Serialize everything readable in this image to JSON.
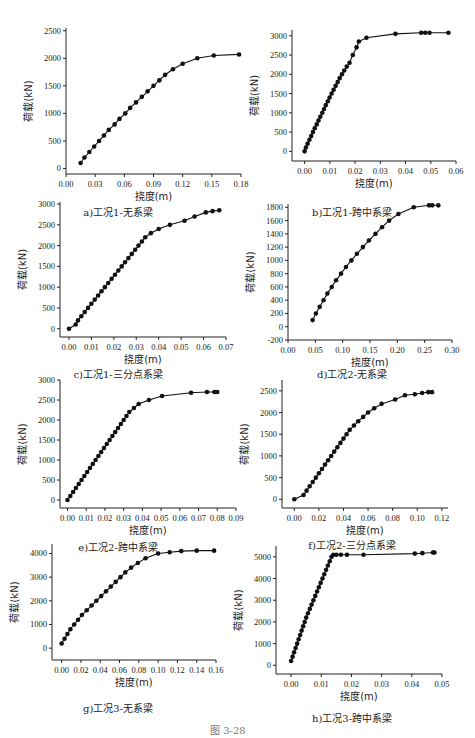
{
  "figure": {
    "caption": "图  3-28"
  },
  "chart_data": [
    {
      "id": "a",
      "type": "line",
      "title": "a)工况1-无系梁",
      "xlabel": "挠度(m)",
      "ylabel": "荷载(kN)",
      "xlim": [
        0.0,
        0.18
      ],
      "ylim": [
        -100,
        2550
      ],
      "xticks": [
        0.0,
        0.03,
        0.06,
        0.09,
        0.12,
        0.15,
        0.18
      ],
      "xtick_labels": [
        "0.00",
        "0.03",
        "0.06",
        "0.09",
        "0.12",
        "0.15",
        "0.18"
      ],
      "yticks": [
        0,
        500,
        1000,
        1500,
        2000,
        2500
      ],
      "ytick_labels": [
        "0",
        "500",
        "1000",
        "1500",
        "2000",
        "2500"
      ],
      "grid": false,
      "markers": true,
      "x": [
        0.015,
        0.019,
        0.024,
        0.029,
        0.034,
        0.039,
        0.044,
        0.05,
        0.055,
        0.061,
        0.066,
        0.072,
        0.078,
        0.084,
        0.09,
        0.096,
        0.102,
        0.11,
        0.12,
        0.135,
        0.152,
        0.178
      ],
      "y": [
        100,
        200,
        300,
        400,
        500,
        600,
        700,
        800,
        900,
        1000,
        1100,
        1200,
        1300,
        1400,
        1500,
        1600,
        1700,
        1800,
        1900,
        2000,
        2050,
        2070
      ]
    },
    {
      "id": "b",
      "type": "line",
      "title": "b)工况1-跨中系梁",
      "xlabel": "挠度(m)",
      "ylabel": "荷载(kN)",
      "xlim": [
        -0.005,
        0.06
      ],
      "ylim": [
        -250,
        3150
      ],
      "xticks": [
        0.0,
        0.01,
        0.02,
        0.03,
        0.04,
        0.05,
        0.06
      ],
      "xtick_labels": [
        "0.00",
        "0.01",
        "0.02",
        "0.03",
        "0.04",
        "0.05",
        "0.06"
      ],
      "yticks": [
        0,
        500,
        1000,
        1500,
        2000,
        2500,
        3000
      ],
      "ytick_labels": [
        "0",
        "500",
        "1000",
        "1500",
        "2000",
        "2500",
        "3000"
      ],
      "grid": false,
      "markers": true,
      "x": [
        0.0,
        0.0005,
        0.0012,
        0.0019,
        0.0026,
        0.0033,
        0.004,
        0.0048,
        0.0055,
        0.0062,
        0.007,
        0.0077,
        0.0084,
        0.0092,
        0.0099,
        0.0107,
        0.0115,
        0.0123,
        0.0131,
        0.0139,
        0.0148,
        0.0157,
        0.0167,
        0.0178,
        0.0191,
        0.0206,
        0.0215,
        0.0245,
        0.036,
        0.0462,
        0.0478,
        0.0495,
        0.057
      ],
      "y": [
        0,
        100,
        200,
        300,
        400,
        500,
        600,
        700,
        800,
        900,
        1000,
        1100,
        1200,
        1300,
        1400,
        1500,
        1600,
        1700,
        1800,
        1900,
        2000,
        2100,
        2200,
        2300,
        2500,
        2700,
        2850,
        2950,
        3050,
        3080,
        3080,
        3080,
        3080
      ]
    },
    {
      "id": "c",
      "type": "line",
      "title": "c)工况1-三分点系梁",
      "xlabel": "挠度(m)",
      "ylabel": "荷载(kN)",
      "xlim": [
        -0.004,
        0.07
      ],
      "ylim": [
        -200,
        3050
      ],
      "xticks": [
        0.0,
        0.01,
        0.02,
        0.03,
        0.04,
        0.05,
        0.06,
        0.07
      ],
      "xtick_labels": [
        "0.00",
        "0.01",
        "0.02",
        "0.03",
        "0.04",
        "0.05",
        "0.06",
        "0.07"
      ],
      "yticks": [
        0,
        500,
        1000,
        1500,
        2000,
        2500,
        3000
      ],
      "ytick_labels": [
        "0",
        "500",
        "1000",
        "1500",
        "2000",
        "2500",
        "3000"
      ],
      "grid": false,
      "markers": true,
      "x": [
        0.0,
        0.003,
        0.004,
        0.0055,
        0.007,
        0.0085,
        0.01,
        0.0115,
        0.013,
        0.0145,
        0.016,
        0.0175,
        0.019,
        0.0205,
        0.022,
        0.0235,
        0.025,
        0.0265,
        0.028,
        0.0295,
        0.031,
        0.0325,
        0.034,
        0.0365,
        0.04,
        0.045,
        0.0515,
        0.056,
        0.061,
        0.064,
        0.067
      ],
      "y": [
        0,
        100,
        200,
        300,
        400,
        500,
        600,
        700,
        800,
        900,
        1000,
        1100,
        1200,
        1300,
        1400,
        1500,
        1600,
        1700,
        1800,
        1900,
        2000,
        2100,
        2200,
        2300,
        2500,
        2600,
        2700,
        2800,
        2830,
        2850,
        2850
      ],
      "y_fixed": [
        0,
        100,
        200,
        300,
        400,
        500,
        600,
        700,
        800,
        900,
        1000,
        1100,
        1200,
        1300,
        1400,
        1500,
        1600,
        1700,
        1800,
        1900,
        2000,
        2100,
        2200,
        2300,
        2400,
        2500,
        2600,
        2700,
        2800,
        2830,
        2850
      ]
    },
    {
      "id": "d",
      "type": "line",
      "title": "d)工况2-无系梁",
      "xlabel": "挠度(m)",
      "ylabel": "荷载(kN)",
      "xlim": [
        0.0,
        0.3
      ],
      "ylim": [
        -200,
        1850
      ],
      "xticks": [
        0.0,
        0.05,
        0.1,
        0.15,
        0.2,
        0.25,
        0.3
      ],
      "xtick_labels": [
        "0.00",
        "0.05",
        "0.10",
        "0.15",
        "0.20",
        "0.25",
        "0.30"
      ],
      "yticks": [
        -200,
        0,
        200,
        400,
        600,
        800,
        1000,
        1200,
        1400,
        1600,
        1800
      ],
      "ytick_labels": [
        "-200",
        "0",
        "200",
        "400",
        "600",
        "800",
        "1000",
        "1200",
        "1400",
        "1600",
        "1800"
      ],
      "grid": false,
      "markers": true,
      "x": [
        0.045,
        0.051,
        0.058,
        0.065,
        0.072,
        0.08,
        0.088,
        0.097,
        0.106,
        0.116,
        0.126,
        0.137,
        0.148,
        0.16,
        0.172,
        0.185,
        0.202,
        0.23,
        0.258,
        0.264,
        0.275
      ],
      "y": [
        100,
        200,
        300,
        400,
        500,
        600,
        700,
        800,
        900,
        1000,
        1100,
        1200,
        1300,
        1400,
        1500,
        1600,
        1700,
        1800,
        1830,
        1830,
        1830
      ]
    },
    {
      "id": "e",
      "type": "line",
      "title": "e)工况2-跨中系梁",
      "xlabel": "挠度(m)",
      "ylabel": "荷载(kN)",
      "xlim": [
        -0.004,
        0.09
      ],
      "ylim": [
        -200,
        3000
      ],
      "xticks": [
        0.0,
        0.01,
        0.02,
        0.03,
        0.04,
        0.05,
        0.06,
        0.07,
        0.08,
        0.09
      ],
      "xtick_labels": [
        "0.00",
        "0.01",
        "0.02",
        "0.03",
        "0.04",
        "0.05",
        "0.06",
        "0.07",
        "0.08",
        "0.09"
      ],
      "yticks": [
        0,
        500,
        1000,
        1500,
        2000,
        2500,
        3000
      ],
      "ytick_labels": [
        "0",
        "500",
        "1000",
        "1500",
        "2000",
        "2500",
        "3000"
      ],
      "grid": false,
      "markers": true,
      "x": [
        0.0,
        0.0015,
        0.003,
        0.0045,
        0.006,
        0.0075,
        0.009,
        0.0105,
        0.012,
        0.0135,
        0.015,
        0.0165,
        0.018,
        0.0195,
        0.021,
        0.0225,
        0.024,
        0.0255,
        0.027,
        0.0285,
        0.03,
        0.0315,
        0.033,
        0.0355,
        0.038,
        0.0435,
        0.0505,
        0.066,
        0.0745,
        0.0785,
        0.08
      ],
      "y": [
        0,
        100,
        200,
        300,
        400,
        500,
        600,
        700,
        800,
        900,
        1000,
        1100,
        1200,
        1300,
        1400,
        1500,
        1600,
        1700,
        1800,
        1900,
        2000,
        2100,
        2200,
        2300,
        2400,
        2500,
        2600,
        2680,
        2700,
        2700,
        2700
      ]
    },
    {
      "id": "f",
      "type": "line",
      "title": "f)工况2-三分点系梁",
      "xlabel": "挠度(m)",
      "ylabel": "荷载(kN)",
      "xlim": [
        -0.01,
        0.125
      ],
      "ylim": [
        -200,
        2750
      ],
      "xticks": [
        0.0,
        0.02,
        0.04,
        0.06,
        0.08,
        0.1,
        0.12
      ],
      "xtick_labels": [
        "0.00",
        "0.02",
        "0.04",
        "0.06",
        "0.08",
        "0.10",
        "0.12"
      ],
      "yticks": [
        0,
        500,
        1000,
        1500,
        2000,
        2500
      ],
      "ytick_labels": [
        "0",
        "500",
        "1000",
        "1500",
        "2000",
        "2500"
      ],
      "grid": false,
      "markers": true,
      "x": [
        0.0,
        0.0075,
        0.01,
        0.0125,
        0.015,
        0.0175,
        0.02,
        0.0225,
        0.025,
        0.0275,
        0.03,
        0.0325,
        0.035,
        0.0375,
        0.04,
        0.0425,
        0.045,
        0.0485,
        0.052,
        0.056,
        0.06,
        0.065,
        0.071,
        0.082,
        0.09,
        0.098,
        0.104,
        0.109,
        0.112
      ],
      "y": [
        0,
        100,
        200,
        300,
        400,
        500,
        600,
        700,
        800,
        900,
        1000,
        1100,
        1200,
        1300,
        1400,
        1500,
        1600,
        1700,
        1800,
        1900,
        2000,
        2100,
        2200,
        2300,
        2400,
        2420,
        2450,
        2470,
        2470
      ]
    },
    {
      "id": "g",
      "type": "line",
      "title": "g)工况3-无系梁",
      "xlabel": "挠度(m)",
      "ylabel": "荷载(kN)",
      "xlim": [
        -0.01,
        0.16
      ],
      "ylim": [
        -500,
        4400
      ],
      "xticks": [
        0.0,
        0.02,
        0.04,
        0.06,
        0.08,
        0.1,
        0.12,
        0.14,
        0.16
      ],
      "xtick_labels": [
        "0.00",
        "0.02",
        "0.04",
        "0.06",
        "0.08",
        "0.10",
        "0.12",
        "0.14",
        "0.16"
      ],
      "yticks": [
        0,
        1000,
        2000,
        3000,
        4000
      ],
      "ytick_labels": [
        "0",
        "1000",
        "2000",
        "3000",
        "4000"
      ],
      "grid": false,
      "markers": true,
      "x": [
        0.0,
        0.003,
        0.006,
        0.009,
        0.013,
        0.017,
        0.021,
        0.026,
        0.031,
        0.036,
        0.041,
        0.046,
        0.051,
        0.056,
        0.061,
        0.066,
        0.072,
        0.079,
        0.087,
        0.1,
        0.112,
        0.124,
        0.14,
        0.158
      ],
      "y": [
        200,
        400,
        600,
        800,
        1000,
        1200,
        1400,
        1600,
        1800,
        2000,
        2200,
        2400,
        2600,
        2800,
        3000,
        3200,
        3400,
        3600,
        3800,
        4000,
        4050,
        4100,
        4120,
        4120
      ]
    },
    {
      "id": "h",
      "type": "line",
      "title": "h)工况3-跨中系梁",
      "xlabel": "挠度(m)",
      "ylabel": "荷载(kN)",
      "xlim": [
        -0.005,
        0.05
      ],
      "ylim": [
        -400,
        5500
      ],
      "xticks": [
        0.0,
        0.01,
        0.02,
        0.03,
        0.04,
        0.05
      ],
      "xtick_labels": [
        "0.00",
        "0.01",
        "0.02",
        "0.03",
        "0.04",
        "0.05"
      ],
      "yticks": [
        0,
        1000,
        2000,
        3000,
        4000,
        5000
      ],
      "ytick_labels": [
        "0",
        "1000",
        "2000",
        "3000",
        "4000",
        "5000"
      ],
      "grid": false,
      "markers": true,
      "x": [
        0.0,
        0.0005,
        0.001,
        0.0015,
        0.002,
        0.0025,
        0.003,
        0.0035,
        0.004,
        0.0045,
        0.005,
        0.0056,
        0.0062,
        0.0068,
        0.0074,
        0.008,
        0.0086,
        0.0092,
        0.0098,
        0.0104,
        0.011,
        0.0116,
        0.0122,
        0.0128,
        0.0134,
        0.014,
        0.015,
        0.0165,
        0.0185,
        0.024,
        0.041,
        0.0435,
        0.047,
        0.0475
      ],
      "y": [
        200,
        400,
        600,
        800,
        1000,
        1200,
        1400,
        1600,
        1800,
        2000,
        2200,
        2400,
        2600,
        2800,
        3000,
        3200,
        3400,
        3600,
        3800,
        4000,
        4200,
        4400,
        4600,
        4800,
        5000,
        5100,
        4200,
        4600,
        4800,
        5000,
        5150,
        5170,
        5200,
        5200
      ]
    }
  ]
}
